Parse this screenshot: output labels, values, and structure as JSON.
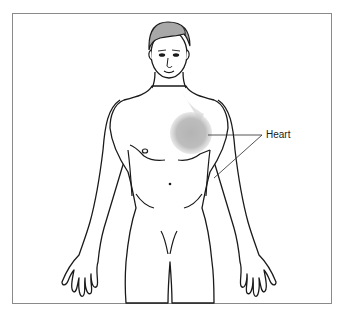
{
  "figure": {
    "highlight": {
      "organ": "Heart",
      "color": "#b8b8b8"
    },
    "callouts": [
      {
        "label": "Heart",
        "x": 266,
        "y": 131
      }
    ]
  },
  "colors": {
    "frame_border": "#8a8a8a",
    "outline": "#1a1a1a",
    "skin": "#ffffff",
    "hair": "#9a9a9a",
    "heart_glow": "#c4c4c4"
  }
}
